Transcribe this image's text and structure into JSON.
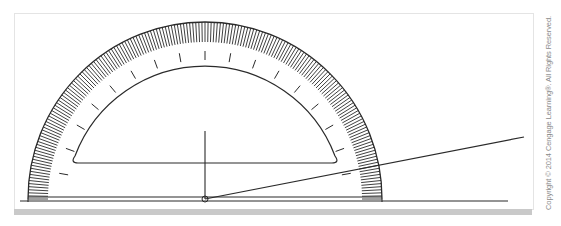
{
  "figure": {
    "center": [
      205,
      199
    ],
    "outer_radius": 177,
    "scale_inner_radius": 157,
    "inner_arc_radius": 139,
    "ray_end": [
      524,
      137
    ],
    "baseline_end_x": 508,
    "colors": {
      "stroke": "#2a2a2a",
      "frame": "#e2e2e2",
      "band": "#c8c8c8",
      "background": "#ffffff"
    }
  },
  "copyright": {
    "text": "Copyright © 2014 Cengage Learning®. All Rights Reserved."
  }
}
